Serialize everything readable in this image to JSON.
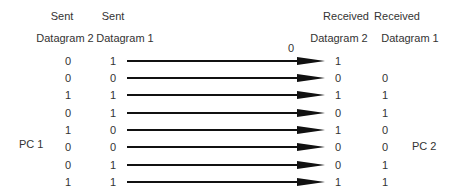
{
  "headers": {
    "sent_dg2_line1": "Sent",
    "sent_dg2_line2": "Datagram 2",
    "sent_dg1_line1": "Sent",
    "sent_dg1_line2": "Datagram 1",
    "recv_dg2_line1": "Received",
    "recv_dg2_line2": "Datagram 2",
    "recv_dg1_line1": "Received",
    "recv_dg1_line2": "Datagram 1"
  },
  "stray_label": "0",
  "left_label": "PC 1",
  "right_label": "PC 2",
  "rows": [
    {
      "sent_dg2": "0",
      "sent_dg1": "1",
      "recv_dg2": "1",
      "recv_dg1": ""
    },
    {
      "sent_dg2": "0",
      "sent_dg1": "0",
      "recv_dg2": "0",
      "recv_dg1": "0"
    },
    {
      "sent_dg2": "1",
      "sent_dg1": "1",
      "recv_dg2": "1",
      "recv_dg1": "1"
    },
    {
      "sent_dg2": "0",
      "sent_dg1": "1",
      "recv_dg2": "0",
      "recv_dg1": "1"
    },
    {
      "sent_dg2": "1",
      "sent_dg1": "0",
      "recv_dg2": "1",
      "recv_dg1": "0"
    },
    {
      "sent_dg2": "0",
      "sent_dg1": "0",
      "recv_dg2": "0",
      "recv_dg1": "0"
    },
    {
      "sent_dg2": "0",
      "sent_dg1": "1",
      "recv_dg2": "0",
      "recv_dg1": "1"
    },
    {
      "sent_dg2": "1",
      "sent_dg1": "1",
      "recv_dg2": "1",
      "recv_dg1": "1"
    }
  ]
}
